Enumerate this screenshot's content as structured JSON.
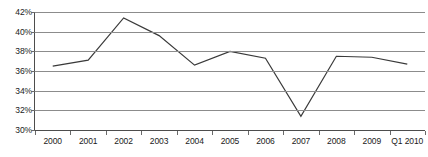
{
  "chart_data": {
    "type": "line",
    "title": "",
    "subtitle": "",
    "xlabel": "",
    "ylabel": "",
    "categories": [
      "2000",
      "2001",
      "2002",
      "2003",
      "2004",
      "2005",
      "2006",
      "2007",
      "2008",
      "2009",
      "Q1 2010"
    ],
    "values": [
      36.5,
      37.1,
      41.4,
      39.6,
      36.6,
      38.0,
      37.3,
      31.4,
      37.5,
      37.4,
      36.7
    ],
    "series": [
      {
        "name": "",
        "values": [
          36.5,
          37.1,
          41.4,
          39.6,
          36.6,
          38.0,
          37.3,
          31.4,
          37.5,
          37.4,
          36.7
        ]
      }
    ],
    "ylim": [
      30,
      42
    ],
    "ytick_step": 2,
    "ytick_labels": [
      "42%",
      "40%",
      "38%",
      "36%",
      "34%",
      "32%",
      "30%"
    ],
    "ytick_values": [
      42,
      40,
      38,
      36,
      34,
      32,
      30
    ],
    "grid": true,
    "grid_axis": "y",
    "legend": false,
    "legend_position": "none",
    "markers": false,
    "line_color": "#3a3a3a",
    "grid_color": "#8c8c8c",
    "axis_color": "#4d4d4d",
    "text_color": "#1a1a1a",
    "background_color": "#ffffff",
    "annotations": []
  }
}
